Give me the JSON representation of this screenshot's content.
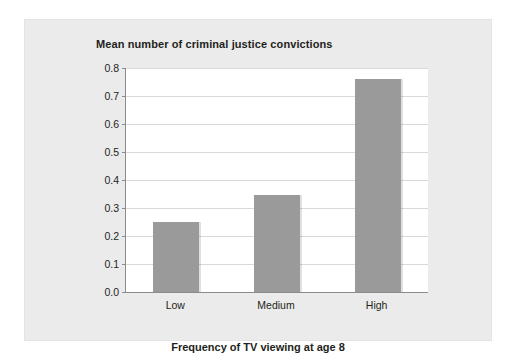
{
  "chart_data": {
    "type": "bar",
    "title": "Mean number of criminal justice convictions",
    "xlabel": "Frequency of TV viewing at age 8",
    "ylabel": "",
    "categories": [
      "Low",
      "Medium",
      "High"
    ],
    "values": [
      0.25,
      0.345,
      0.76
    ],
    "ylim": [
      0.0,
      0.8
    ],
    "ytick_labels": [
      "0.8",
      "0.7",
      "0.6",
      "0.5",
      "0.4",
      "0.3",
      "0.2",
      "0.1",
      "0.0"
    ],
    "ytick_values": [
      0.8,
      0.7,
      0.6,
      0.5,
      0.4,
      0.3,
      0.2,
      0.1,
      0.0
    ],
    "grid": true,
    "legend": "none",
    "series": [
      {
        "name": "Mean number of criminal justice convictions",
        "values": [
          0.25,
          0.345,
          0.76
        ],
        "color": "#9a9a9a"
      }
    ],
    "colors": {
      "bar": "#9a9a9a",
      "panel_background": "#ebebeb",
      "plot_background": "#ffffff",
      "gridline": "#d9d9d9",
      "axis": "#8c8c8c",
      "text": "#231f20"
    }
  }
}
